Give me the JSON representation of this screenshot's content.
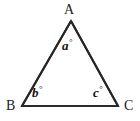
{
  "figure": {
    "type": "geometry-diagram",
    "shape": "triangle",
    "background_color": "#ffffff",
    "stroke_color": "#262626",
    "stroke_width": 2,
    "vertices": [
      {
        "id": "A",
        "label": "A",
        "x": 71,
        "y": 21,
        "label_x": 64,
        "label_y": 3
      },
      {
        "id": "B",
        "label": "B",
        "x": 22,
        "y": 106,
        "label_x": 6,
        "label_y": 99
      },
      {
        "id": "C",
        "label": "C",
        "x": 118,
        "y": 106,
        "label_x": 124,
        "label_y": 99
      }
    ],
    "edges": [
      {
        "id": "edge-AB",
        "from": "A",
        "to": "B"
      },
      {
        "id": "edge-BC",
        "from": "B",
        "to": "C"
      },
      {
        "id": "edge-CA",
        "from": "C",
        "to": "A"
      }
    ],
    "angles": [
      {
        "id": "angle-a",
        "at_vertex": "A",
        "variable": "a",
        "degree_symbol": "°",
        "label_x": 62,
        "label_y": 38
      },
      {
        "id": "angle-b",
        "at_vertex": "B",
        "variable": "b",
        "degree_symbol": "°",
        "label_x": 32,
        "label_y": 85
      },
      {
        "id": "angle-c",
        "at_vertex": "C",
        "variable": "c",
        "degree_symbol": "°",
        "label_x": 93,
        "label_y": 85
      }
    ]
  }
}
